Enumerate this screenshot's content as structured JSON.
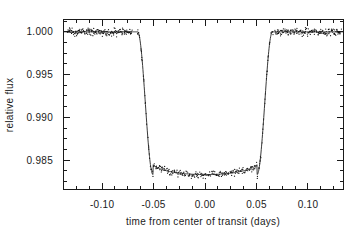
{
  "figure": {
    "background_color": "#ffffff",
    "foreground_color": "#1a1a1a"
  },
  "chart_data": {
    "type": "scatter",
    "title": "",
    "subtitle": "",
    "xlabel": "time from center of transit (days)",
    "ylabel": "relative flux",
    "xlim": [
      -0.138,
      0.135
    ],
    "ylim": [
      0.9815,
      1.0015
    ],
    "grid": false,
    "legend": null,
    "legend_position": "none",
    "xticks": [
      -0.1,
      -0.05,
      0.0,
      0.05,
      0.1
    ],
    "xticklabels": [
      "-0.10",
      "-0.05",
      "0.00",
      "0.05",
      "0.10"
    ],
    "x_minor_tick_interval": 0.0125,
    "yticks": [
      0.985,
      0.99,
      0.995,
      1.0
    ],
    "yticklabels": [
      "0.985",
      "0.990",
      "0.995",
      "1.000"
    ],
    "y_minor_tick_interval": 0.00125,
    "annotations": [],
    "transit": {
      "out_of_transit_flux": 1.0,
      "transit_depth": 0.0167,
      "minimum_flux": 0.9833,
      "first_contact": -0.0655,
      "second_contact": -0.0505,
      "third_contact": 0.0505,
      "fourth_contact": 0.0655,
      "total_duration_days": 0.131,
      "limb_darkened": true
    },
    "series": [
      {
        "name": "model light curve",
        "type": "line",
        "color": "#222222",
        "description": "limb-darkened transit model fit"
      },
      {
        "name": "photometric measurements",
        "type": "scatter",
        "color": "#111111",
        "marker": "point",
        "n_points": 640,
        "scatter_rms": 0.00028,
        "description": "relative flux measurements folded on the transit ephemeris"
      }
    ],
    "x": [
      -0.135,
      -0.13,
      -0.125,
      -0.12,
      -0.115,
      -0.11,
      -0.105,
      -0.1,
      -0.095,
      -0.09,
      -0.085,
      -0.08,
      -0.075,
      -0.07,
      -0.066,
      -0.062,
      -0.058,
      -0.054,
      -0.05,
      -0.045,
      -0.04,
      -0.035,
      -0.03,
      -0.025,
      -0.02,
      -0.015,
      -0.01,
      -0.005,
      0.0,
      0.005,
      0.01,
      0.015,
      0.02,
      0.025,
      0.03,
      0.035,
      0.04,
      0.045,
      0.05,
      0.054,
      0.058,
      0.062,
      0.066,
      0.07,
      0.075,
      0.08,
      0.085,
      0.09,
      0.095,
      0.1,
      0.105,
      0.11,
      0.115,
      0.12,
      0.125,
      0.13
    ],
    "values": [
      1.0,
      1.0,
      1.0,
      1.0,
      1.0,
      1.0,
      1.0,
      1.0,
      1.0,
      1.0,
      1.0,
      1.0,
      1.0,
      1.0,
      0.9999,
      0.9973,
      0.992,
      0.9875,
      0.985,
      0.9843,
      0.9839,
      0.9837,
      0.9835,
      0.9834,
      0.9834,
      0.9833,
      0.9833,
      0.9833,
      0.9833,
      0.9833,
      0.9833,
      0.9834,
      0.9834,
      0.9835,
      0.9836,
      0.9838,
      0.984,
      0.9844,
      0.985,
      0.9875,
      0.992,
      0.9973,
      0.9999,
      1.0,
      1.0,
      1.0,
      1.0,
      1.0,
      1.0,
      1.0,
      1.0,
      1.0,
      1.0,
      1.0,
      1.0,
      1.0
    ]
  },
  "axes_geometry": {
    "left_px": 63,
    "right_px": 344,
    "top_px": 19,
    "bottom_px": 190
  }
}
